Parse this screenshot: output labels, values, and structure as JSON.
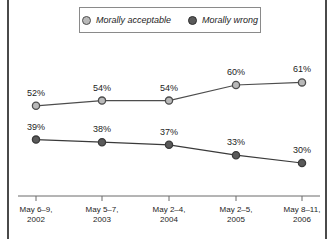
{
  "legend": {
    "entries": [
      {
        "label": "Morally acceptable",
        "marker": "circle-open-gray",
        "color": "#b9b9b9"
      },
      {
        "label": "Morally wrong",
        "marker": "circle-filled-dark",
        "color": "#5a5a5a"
      }
    ]
  },
  "chart_data": {
    "type": "line",
    "title": "",
    "subtitle": "",
    "xlabel": "",
    "ylabel": "",
    "ylim": [
      25,
      65
    ],
    "grid": false,
    "legend_position": "top-center",
    "categories": [
      "May 6–9, 2002",
      "May 5–7, 2003",
      "May 2–4, 2004",
      "May 2–5, 2005",
      "May 8–11, 2006"
    ],
    "categories_lines": [
      [
        "May 6–9,",
        "2002"
      ],
      [
        "May 5–7,",
        "2003"
      ],
      [
        "May 2–4,",
        "2004"
      ],
      [
        "May 2–5,",
        "2005"
      ],
      [
        "May 8–11,",
        "2006"
      ]
    ],
    "series": [
      {
        "name": "Morally acceptable",
        "values": [
          52,
          54,
          54,
          60,
          61
        ],
        "labels": [
          "52%",
          "54%",
          "54%",
          "60%",
          "61%"
        ],
        "color": "#b9b9b9",
        "line_color": "#4d4d4d"
      },
      {
        "name": "Morally wrong",
        "values": [
          39,
          38,
          37,
          33,
          30
        ],
        "labels": [
          "39%",
          "38%",
          "37%",
          "33%",
          "30%"
        ],
        "color": "#5a5a5a",
        "line_color": "#3a3a3a"
      }
    ]
  },
  "axis": {
    "line_color": "#6b6b6b",
    "tick_count": 5
  },
  "colors": {
    "frame": "#4a4a4a",
    "text": "#1d1d1d",
    "background": "#ffffff"
  }
}
